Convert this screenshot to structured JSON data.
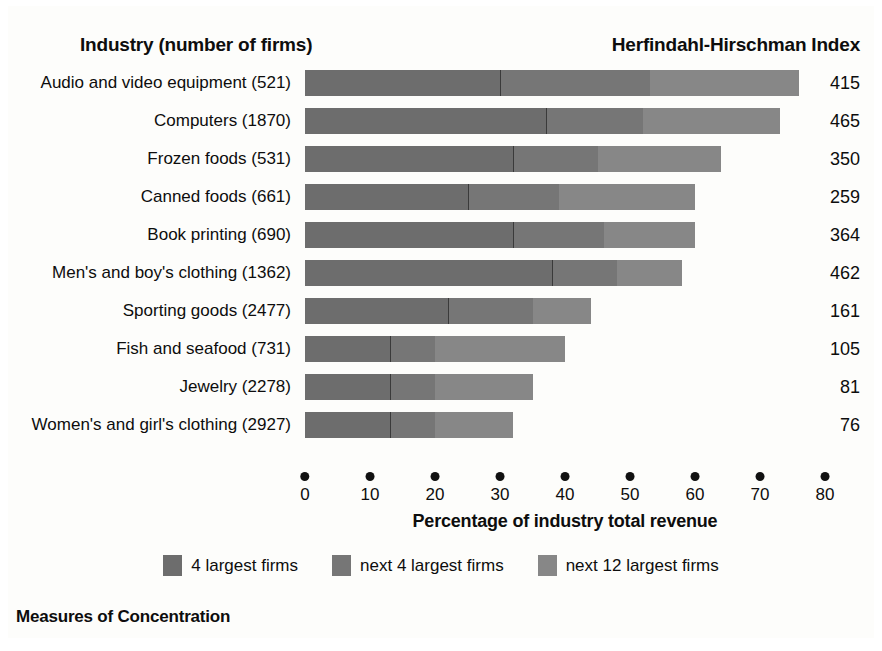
{
  "header": {
    "left_title": "Industry (number of firms)",
    "right_title": "Herfindahl-Hirschman Index"
  },
  "caption": "Measures of Concentration",
  "colors": {
    "segment_4_largest": "#6d6d6d",
    "segment_next_4": "#767676",
    "segment_next_12": "#878787",
    "text": "#0d0d0d",
    "background": "#fdfdfb"
  },
  "legend": {
    "items": [
      {
        "label": "4 largest firms",
        "color": "#6d6d6d"
      },
      {
        "label": "next 4 largest firms",
        "color": "#767676"
      },
      {
        "label": "next 12 largest firms",
        "color": "#878787"
      }
    ]
  },
  "chart_data": {
    "type": "bar",
    "orientation": "horizontal",
    "stacked": true,
    "title": "Measures of Concentration",
    "xlabel": "Percentage of industry total revenue",
    "ylabel": "Industry (number of firms)",
    "xlim": [
      0,
      80
    ],
    "xticks": [
      0,
      10,
      20,
      30,
      40,
      50,
      60,
      70,
      80
    ],
    "xticklabels": [
      "0",
      "10",
      "20",
      "30",
      "40",
      "50",
      "60",
      "70",
      "80"
    ],
    "grid": false,
    "legend_position": "bottom",
    "value_column_header": "Herfindahl-Hirschman Index",
    "categories": [
      "Audio and video equipment",
      "Computers",
      "Frozen foods",
      "Canned foods",
      "Book printing",
      "Men's and boy's clothing",
      "Sporting goods",
      "Fish and seafood",
      "Jewelry",
      "Women's and girl's clothing"
    ],
    "firm_counts": [
      521,
      1870,
      531,
      661,
      690,
      1362,
      2477,
      731,
      2278,
      2927
    ],
    "category_labels": [
      "Audio and video equipment  (521)",
      "Computers  (1870)",
      "Frozen foods  (531)",
      "Canned foods  (661)",
      "Book printing  (690)",
      "Men's and boy's clothing  (1362)",
      "Sporting goods  (2477)",
      "Fish and seafood  (731)",
      "Jewelry  (2278)",
      "Women's and girl's clothing  (2927)"
    ],
    "series": [
      {
        "name": "4 largest firms",
        "color": "#6d6d6d",
        "values": [
          30,
          37,
          32,
          25,
          32,
          38,
          22,
          13,
          13,
          13
        ]
      },
      {
        "name": "next 4 largest firms",
        "color": "#767676",
        "values": [
          23,
          15,
          13,
          14,
          14,
          10,
          13,
          7,
          7,
          7
        ]
      },
      {
        "name": "next 12 largest firms",
        "color": "#878787",
        "values": [
          23,
          21,
          19,
          21,
          14,
          10,
          9,
          20,
          15,
          12
        ]
      }
    ],
    "totals": [
      76,
      73,
      64,
      60,
      60,
      58,
      44,
      40,
      35,
      32
    ],
    "hhi_values": [
      415,
      465,
      350,
      259,
      364,
      462,
      161,
      105,
      81,
      76
    ]
  }
}
